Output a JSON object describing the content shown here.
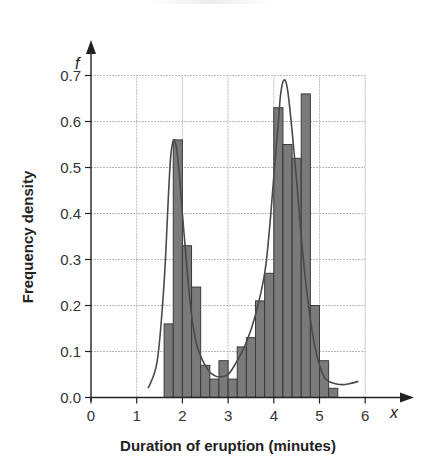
{
  "chart_data": {
    "type": "bar",
    "subtype": "histogram-with-density-curve",
    "title": "",
    "xlabel": "Duration of eruption (minutes)",
    "ylabel": "Frequency density",
    "x_axis_variable": "x",
    "y_axis_variable": "f",
    "xlim": [
      0,
      6
    ],
    "ylim": [
      0,
      0.7
    ],
    "x_ticks": [
      "0",
      "1",
      "2",
      "3",
      "4",
      "5",
      "6"
    ],
    "y_ticks": [
      "0.0",
      "0.1",
      "0.2",
      "0.3",
      "0.4",
      "0.5",
      "0.6",
      "0.7"
    ],
    "grid": true,
    "bin_width": 0.2,
    "categories": [
      "1.6-1.8",
      "1.8-2.0",
      "2.0-2.2",
      "2.2-2.4",
      "2.4-2.6",
      "2.6-2.8",
      "2.8-3.0",
      "3.0-3.2",
      "3.2-3.4",
      "3.4-3.6",
      "3.6-3.8",
      "3.8-4.0",
      "4.0-4.2",
      "4.2-4.4",
      "4.4-4.6",
      "4.6-4.8",
      "4.8-5.0",
      "5.0-5.2",
      "5.2-5.4"
    ],
    "bin_starts": [
      1.6,
      1.8,
      2.0,
      2.2,
      2.4,
      2.6,
      2.8,
      3.0,
      3.2,
      3.4,
      3.6,
      3.8,
      4.0,
      4.2,
      4.4,
      4.6,
      4.8,
      5.0,
      5.2
    ],
    "values": [
      0.16,
      0.56,
      0.33,
      0.24,
      0.07,
      0.04,
      0.08,
      0.04,
      0.11,
      0.13,
      0.21,
      0.27,
      0.63,
      0.55,
      0.52,
      0.66,
      0.2,
      0.08,
      0.02
    ],
    "curve": {
      "name": "density curve",
      "x": [
        1.25,
        1.45,
        1.6,
        1.7,
        1.75,
        1.82,
        1.9,
        2.0,
        2.1,
        2.2,
        2.3,
        2.4,
        2.5,
        2.6,
        2.7,
        2.8,
        3.0,
        3.2,
        3.4,
        3.6,
        3.8,
        3.9,
        4.0,
        4.1,
        4.15,
        4.22,
        4.3,
        4.4,
        4.5,
        4.6,
        4.7,
        4.8,
        4.9,
        5.0,
        5.1,
        5.2,
        5.35,
        5.5,
        5.65,
        5.85
      ],
      "y": [
        0.02,
        0.08,
        0.25,
        0.45,
        0.53,
        0.56,
        0.52,
        0.4,
        0.28,
        0.18,
        0.12,
        0.09,
        0.07,
        0.055,
        0.048,
        0.045,
        0.05,
        0.08,
        0.12,
        0.18,
        0.27,
        0.36,
        0.48,
        0.6,
        0.66,
        0.69,
        0.67,
        0.58,
        0.47,
        0.35,
        0.25,
        0.17,
        0.11,
        0.07,
        0.045,
        0.035,
        0.03,
        0.028,
        0.03,
        0.035
      ]
    }
  },
  "colors": {
    "bar_fill": "#7a7a7a",
    "bar_stroke": "#3a3a3a",
    "curve": "#4a4a4a",
    "grid": "#b8b8b8",
    "axis": "#222222"
  }
}
